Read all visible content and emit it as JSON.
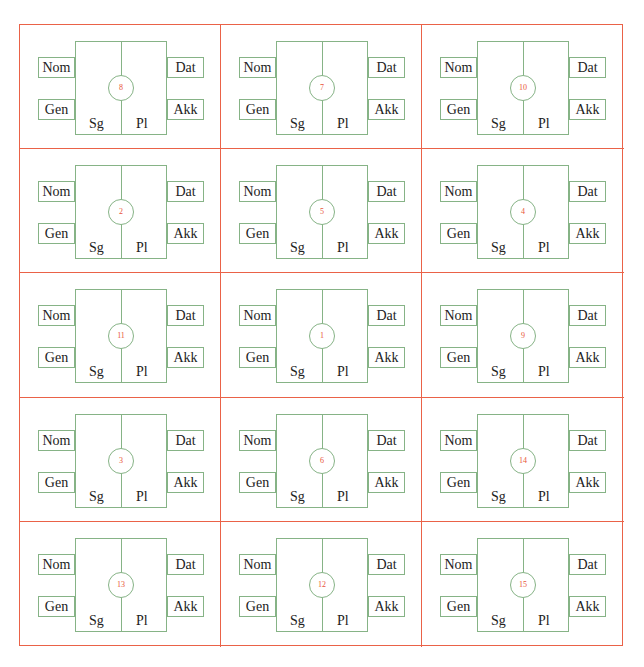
{
  "diagram": {
    "colors": {
      "grid_border": "#EA6248",
      "inner_lines": "#86B386",
      "number_text": "#E8553A",
      "label_text": "#222222"
    },
    "labels": {
      "nom": "Nom",
      "gen": "Gen",
      "dat": "Dat",
      "akk": "Akk",
      "sg": "Sg",
      "pl": "Pl"
    },
    "rows": 5,
    "columns": 3,
    "cells": [
      {
        "number": "8"
      },
      {
        "number": "7"
      },
      {
        "number": "10"
      },
      {
        "number": "2"
      },
      {
        "number": "5"
      },
      {
        "number": "4"
      },
      {
        "number": "11"
      },
      {
        "number": "1"
      },
      {
        "number": "9"
      },
      {
        "number": "3"
      },
      {
        "number": "6"
      },
      {
        "number": "14"
      },
      {
        "number": "13"
      },
      {
        "number": "12"
      },
      {
        "number": "15"
      }
    ]
  }
}
